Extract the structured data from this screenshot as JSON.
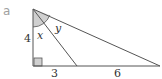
{
  "part_label": "a",
  "labels": {
    "left_side": "4",
    "bottom_left": "3",
    "bottom_right": "6",
    "angle_x": "x",
    "angle_y": "y"
  },
  "colors": {
    "line": "#555555",
    "shade": "#d0d0d0"
  }
}
